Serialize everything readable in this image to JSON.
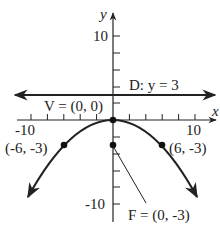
{
  "figure": {
    "type": "parabola-graph",
    "equation_hint": "x^2 = -12y",
    "axes": {
      "x_label": "x",
      "y_label": "y",
      "x_tick_labels": [
        "-10",
        "10"
      ],
      "y_tick_labels": [
        "10",
        "-10"
      ],
      "tick_step": 2
    },
    "directrix": {
      "label": "D: y = 3",
      "y": 3
    },
    "vertex": {
      "label": "V = (0, 0)",
      "x": 0,
      "y": 0
    },
    "focus": {
      "label": "F = (0, -3)",
      "x": 0,
      "y": -3
    },
    "points": [
      {
        "label": "(-6, -3)",
        "x": -6,
        "y": -3
      },
      {
        "label": "(6, -3)",
        "x": 6,
        "y": -3
      }
    ],
    "colors": {
      "ink": "#222222",
      "background": "#ffffff"
    }
  }
}
